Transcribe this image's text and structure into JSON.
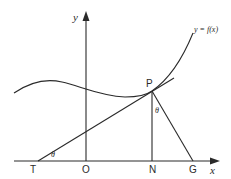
{
  "diagram": {
    "title": "",
    "colors": {
      "stroke": "#2a2a2a",
      "background": "#ffffff"
    },
    "axes": {
      "x_label": "x",
      "y_label": "y"
    },
    "curve_label": "y = f(x)",
    "points": {
      "P": "P",
      "T": "T",
      "O": "O",
      "N": "N",
      "G": "G"
    },
    "angles": {
      "at_T": "θ",
      "at_P": "θ"
    },
    "elements": [
      {
        "type": "curve",
        "name": "y = f(x)"
      },
      {
        "type": "line",
        "name": "tangent",
        "from": "T",
        "through": "P"
      },
      {
        "type": "line",
        "name": "ordinate",
        "from": "P",
        "to": "N"
      },
      {
        "type": "line",
        "name": "normal",
        "from": "P",
        "to": "G"
      }
    ]
  }
}
